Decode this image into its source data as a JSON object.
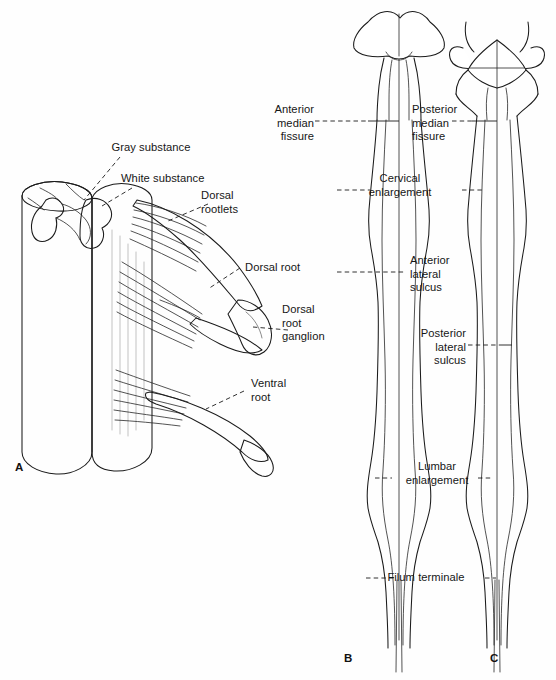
{
  "figure": {
    "background_color": "#fefefe",
    "ink_color": "#1b1b1b",
    "panels": [
      {
        "letter": "A",
        "name": "spinal-cord-segment-with-roots"
      },
      {
        "letter": "B",
        "name": "spinal-cord-anterior-view"
      },
      {
        "letter": "C",
        "name": "spinal-cord-posterior-view"
      }
    ]
  },
  "panel_a": {
    "letter": "A",
    "labels": {
      "gray_substance": "Gray substance",
      "white_substance": "White substance",
      "dorsal_rootlets": "Dorsal\nrootlets",
      "dorsal_root": "Dorsal root",
      "dorsal_root_ganglion": "Dorsal\nroot\nganglion",
      "ventral_root": "Ventral\nroot"
    }
  },
  "panel_b": {
    "letter": "B",
    "labels": {
      "anterior_median_fissure": "Anterior\nmedian\nfissure",
      "anterior_lateral_sulcus": "Anterior\nlateral\nsulcus"
    }
  },
  "panel_c": {
    "letter": "C",
    "labels": {
      "posterior_median_fissure": "Posterior\nmedian\nfissure",
      "posterior_lateral_sulcus": "Posterior\nlateral\nsulcus"
    }
  },
  "shared_labels": {
    "cervical_enlargement": "Cervical\nenlargement",
    "lumbar_enlargement": "Lumbar\nenlargement",
    "filum_terminale": "Filum terminale"
  }
}
